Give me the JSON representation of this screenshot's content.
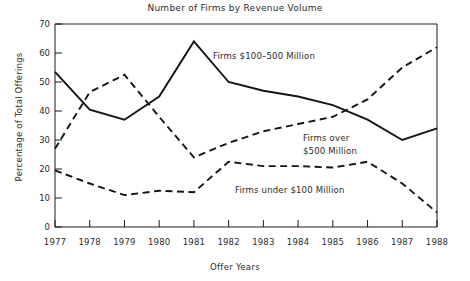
{
  "chart_data": {
    "type": "line",
    "title": "Number of Firms by Revenue Volume",
    "xlabel": "Offer Years",
    "ylabel": "Percentage of Total Offerings",
    "categories": [
      "1977",
      "1978",
      "1979",
      "1980",
      "1981",
      "1982",
      "1983",
      "1984",
      "1985",
      "1986",
      "1987",
      "1988"
    ],
    "x": [
      1977,
      1978,
      1979,
      1980,
      1981,
      1982,
      1983,
      1984,
      1985,
      1986,
      1987,
      1988
    ],
    "xlim": [
      1977,
      1988
    ],
    "ylim": [
      0,
      70
    ],
    "ytick_labels": [
      "0",
      "10",
      "20",
      "30",
      "40",
      "50",
      "60",
      "70"
    ],
    "ytick_values": [
      0,
      10,
      20,
      30,
      40,
      50,
      60,
      70
    ],
    "grid": false,
    "legend_position": "inline-annotations",
    "series": [
      {
        "name": "Firms $100-500 Million",
        "label": "Firms $100–500 Million",
        "style": "solid",
        "color": "#141414",
        "values": [
          53.5,
          40.5,
          37.0,
          45.0,
          64.0,
          50.0,
          47.0,
          45.0,
          42.0,
          37.0,
          30.0,
          34.0
        ]
      },
      {
        "name": "Firms over $500 Million",
        "label": "Firms over $500 Million",
        "label_line1": "Firms over",
        "label_line2": "$500 Million",
        "style": "dashed",
        "color": "#141414",
        "values": [
          27.0,
          46.5,
          52.5,
          38.0,
          24.0,
          29.0,
          33.0,
          35.5,
          38.0,
          44.0,
          55.0,
          62.0
        ]
      },
      {
        "name": "Firms under $100 Million",
        "label": "Firms under $100 Million",
        "style": "dashed",
        "color": "#141414",
        "values": [
          19.5,
          15.0,
          11.0,
          12.5,
          12.0,
          22.5,
          21.0,
          21.0,
          20.5,
          22.5,
          15.0,
          5.0
        ]
      }
    ]
  },
  "annotations": {
    "series_1": "Firms $100–500 Million",
    "series_2_line1": "Firms over",
    "series_2_line2": "$500 Million",
    "series_3": "Firms under $100 Million"
  },
  "axis": {
    "y_ticks": [
      "70",
      "60",
      "50",
      "40",
      "30",
      "20",
      "10",
      "0"
    ],
    "x_ticks": [
      "1977",
      "1978",
      "1979",
      "1980",
      "1981",
      "1982",
      "1983",
      "1984",
      "1985",
      "1986",
      "1987",
      "1988"
    ]
  },
  "colors": {
    "background": "#ffffff",
    "ink": "#141414",
    "text": "#2b2b2b"
  }
}
